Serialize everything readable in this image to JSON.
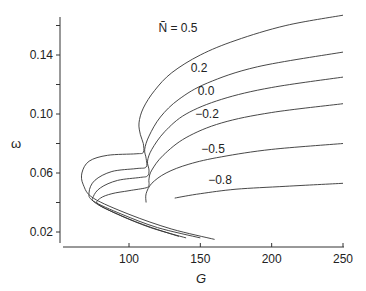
{
  "chart_data": {
    "type": "line",
    "title": "",
    "xlabel": "G",
    "ylabel": "ω",
    "xlim": [
      54,
      250
    ],
    "ylim": [
      0.0125,
      0.166
    ],
    "grid": false,
    "legend_position": "inline curve labels",
    "x_ticks": [
      100,
      150,
      200,
      250
    ],
    "y_ticks": [
      0.02,
      0.06,
      0.1,
      0.14
    ],
    "y_minor_ticks": [
      0.04,
      0.08,
      0.12,
      0.16
    ],
    "parameter_name": "Ñ",
    "series": [
      {
        "name": "Ñ = 0.5",
        "label": "Ñ = 0.5",
        "points": [
          [
            160,
            0.015
          ],
          [
            130,
            0.022
          ],
          [
            100,
            0.032
          ],
          [
            75,
            0.043
          ],
          [
            68,
            0.052
          ],
          [
            67,
            0.06
          ],
          [
            72,
            0.068
          ],
          [
            85,
            0.072
          ],
          [
            105,
            0.073
          ],
          [
            110,
            0.074
          ],
          [
            110,
            0.08
          ],
          [
            108,
            0.086
          ],
          [
            107,
            0.094
          ],
          [
            110,
            0.104
          ],
          [
            118,
            0.116
          ],
          [
            130,
            0.128
          ],
          [
            150,
            0.14
          ],
          [
            175,
            0.15
          ],
          [
            210,
            0.16
          ],
          [
            250,
            0.167
          ]
        ]
      },
      {
        "name": "Ñ = 0.2",
        "label": "0.2",
        "points": [
          [
            150,
            0.016
          ],
          [
            120,
            0.023
          ],
          [
            95,
            0.032
          ],
          [
            75,
            0.041
          ],
          [
            72,
            0.047
          ],
          [
            76,
            0.055
          ],
          [
            88,
            0.061
          ],
          [
            105,
            0.063
          ],
          [
            112,
            0.064
          ],
          [
            112,
            0.07
          ],
          [
            111,
            0.076
          ],
          [
            114,
            0.085
          ],
          [
            122,
            0.098
          ],
          [
            135,
            0.11
          ],
          [
            155,
            0.121
          ],
          [
            190,
            0.132
          ],
          [
            250,
            0.142
          ]
        ]
      },
      {
        "name": "Ñ = 0.0",
        "label": "0.0",
        "points": [
          [
            140,
            0.016
          ],
          [
            115,
            0.023
          ],
          [
            92,
            0.032
          ],
          [
            76,
            0.04
          ],
          [
            75,
            0.044
          ],
          [
            80,
            0.05
          ],
          [
            92,
            0.055
          ],
          [
            108,
            0.057
          ],
          [
            113,
            0.058
          ],
          [
            114,
            0.062
          ],
          [
            113,
            0.068
          ],
          [
            116,
            0.076
          ],
          [
            125,
            0.088
          ],
          [
            140,
            0.1
          ],
          [
            165,
            0.11
          ],
          [
            200,
            0.118
          ],
          [
            250,
            0.125
          ]
        ]
      },
      {
        "name": "Ñ = -0.2",
        "label": "−0.2",
        "points": [
          [
            135,
            0.017
          ],
          [
            110,
            0.025
          ],
          [
            90,
            0.033
          ],
          [
            78,
            0.039
          ],
          [
            80,
            0.043
          ],
          [
            88,
            0.046
          ],
          [
            100,
            0.048
          ],
          [
            112,
            0.05
          ],
          [
            114,
            0.052
          ],
          [
            114,
            0.056
          ],
          [
            116,
            0.062
          ],
          [
            124,
            0.072
          ],
          [
            140,
            0.084
          ],
          [
            165,
            0.094
          ],
          [
            200,
            0.101
          ],
          [
            250,
            0.107
          ]
        ]
      },
      {
        "name": "Ñ = -0.5",
        "label": "−0.5",
        "points": [
          [
            112,
            0.04
          ],
          [
            112,
            0.046
          ],
          [
            116,
            0.053
          ],
          [
            126,
            0.06
          ],
          [
            142,
            0.066
          ],
          [
            165,
            0.071
          ],
          [
            200,
            0.076
          ],
          [
            250,
            0.08
          ]
        ]
      },
      {
        "name": "Ñ = -0.8",
        "label": "−0.8",
        "points": [
          [
            132,
            0.043
          ],
          [
            150,
            0.046
          ],
          [
            175,
            0.049
          ],
          [
            210,
            0.051
          ],
          [
            250,
            0.053
          ]
        ]
      }
    ],
    "annotations": [
      {
        "text": "Ñ = 0.5",
        "x": 150,
        "y": 0.15
      },
      {
        "text": "0.2",
        "x": 150,
        "y": 0.13
      },
      {
        "text": "0.0",
        "x": 160,
        "y": 0.114
      },
      {
        "text": "−0.2",
        "x": 170,
        "y": 0.098
      },
      {
        "text": "−0.5",
        "x": 180,
        "y": 0.074
      },
      {
        "text": "−0.8",
        "x": 190,
        "y": 0.05
      }
    ]
  },
  "axes": {
    "x_title": "G",
    "y_title": "ω",
    "x_tick_labels": [
      "100",
      "150",
      "200",
      "250"
    ],
    "y_tick_labels": [
      "0.02",
      "0.06",
      "0.10",
      "0.14"
    ]
  }
}
